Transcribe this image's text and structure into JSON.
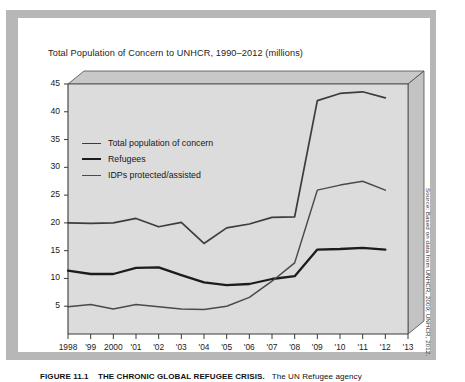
{
  "figure": {
    "title": "Total Population of Concern to UNHCR, 1990–2012 (millions)",
    "source_note": "Source: Based on data from UNHCR, 2009; UNHCR, 2012.",
    "caption_number": "FIGURE 11.1",
    "caption_heading": "THE CHRONIC GLOBAL REFUGEE CRISIS.",
    "caption_text": "The UN Refugee agency"
  },
  "colors": {
    "page_background": "#ffffff",
    "frame_gray": "#b7b7b7",
    "plot_fill": "#dcdcdc",
    "plot_top_face": "#c8c8c8",
    "plot_side_face": "#c3c3c3",
    "axis_line": "#3a3a3a",
    "series_total": "#3d3d3d",
    "series_refugees": "#1c1c1c",
    "series_idp": "#4a4a4a",
    "text": "#1a1a1a"
  },
  "legend": {
    "position": "inside-upper-left",
    "items": [
      {
        "label": "Total population of concern",
        "color": "#3d3d3d",
        "width": 1.7
      },
      {
        "label": "Refugees",
        "color": "#1c1c1c",
        "width": 2.3
      },
      {
        "label": "IDPs protected/assisted",
        "color": "#4a4a4a",
        "width": 1.5
      }
    ]
  },
  "chart_data": {
    "type": "line",
    "title": "Total Population of Concern to UNHCR, 1990–2012 (millions)",
    "xlabel": "",
    "ylabel": "",
    "unit": "millions",
    "grid": false,
    "legend_position": "inside-upper-left",
    "x": [
      1998,
      1999,
      2000,
      2001,
      2002,
      2003,
      2004,
      2005,
      2006,
      2007,
      2008,
      2009,
      2010,
      2011,
      2012
    ],
    "xtick_labels": [
      "1998",
      "'99",
      "2000",
      "'01",
      "'02",
      "'03",
      "'04",
      "'05",
      "'06",
      "'07",
      "'08",
      "'09",
      "'10",
      "'11",
      "'12",
      "'13"
    ],
    "xtick_values": [
      1998,
      1999,
      2000,
      2001,
      2002,
      2003,
      2004,
      2005,
      2006,
      2007,
      2008,
      2009,
      2010,
      2011,
      2012,
      2013
    ],
    "xlim": [
      1998,
      2013
    ],
    "ylim": [
      0,
      45
    ],
    "ytick_labels": [
      "5",
      "10",
      "15",
      "20",
      "25",
      "30",
      "35",
      "40",
      "45"
    ],
    "ytick_values": [
      5,
      10,
      15,
      20,
      25,
      30,
      35,
      40,
      45
    ],
    "series": [
      {
        "name": "Total population of concern",
        "color": "#3d3d3d",
        "values": [
          20.0,
          19.9,
          20.0,
          20.8,
          19.3,
          20.1,
          16.3,
          19.1,
          19.8,
          21.0,
          21.1,
          42.0,
          43.3,
          43.6,
          42.5
        ]
      },
      {
        "name": "Refugees",
        "color": "#1c1c1c",
        "values": [
          11.4,
          10.8,
          10.8,
          11.9,
          12.0,
          10.6,
          9.3,
          8.8,
          9.0,
          9.9,
          10.4,
          15.2,
          15.3,
          15.5,
          15.2
        ]
      },
      {
        "name": "IDPs protected/assisted",
        "color": "#4a4a4a",
        "values": [
          4.9,
          5.3,
          4.5,
          5.3,
          4.9,
          4.5,
          4.4,
          5.0,
          6.6,
          9.5,
          12.8,
          25.9,
          26.8,
          27.5,
          25.9
        ]
      }
    ]
  }
}
